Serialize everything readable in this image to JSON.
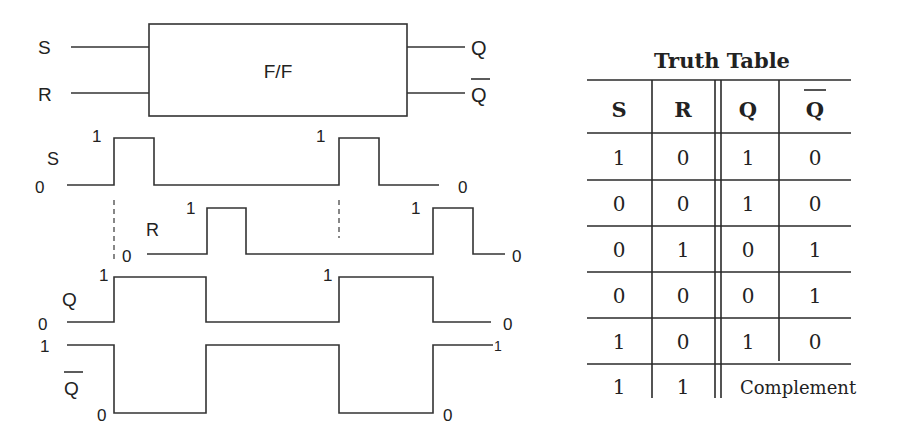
{
  "block": {
    "label": "F/F",
    "inputs": [
      "S",
      "R"
    ],
    "outputs": [
      "Q",
      "Q̄"
    ]
  },
  "timing": {
    "signals": [
      {
        "name": "S",
        "start_level": "0",
        "end_level": "0",
        "pulse_labels": [
          "1",
          "1"
        ]
      },
      {
        "name": "R",
        "start_level": "0",
        "end_level": "0",
        "pulse_labels": [
          "1",
          "1"
        ]
      },
      {
        "name": "Q",
        "start_level": "0",
        "end_level": "0",
        "pulse_labels": [
          "1",
          "1"
        ]
      },
      {
        "name": "Q̄",
        "start_level": "1",
        "end_level": "1",
        "low_labels": [
          "0",
          "0"
        ]
      }
    ]
  },
  "truth_table": {
    "title": "Truth Table",
    "headers": [
      "S",
      "R",
      "Q",
      "Q"
    ],
    "rows": [
      [
        "1",
        "0",
        "1",
        "0"
      ],
      [
        "0",
        "0",
        "1",
        "0"
      ],
      [
        "0",
        "1",
        "0",
        "1"
      ],
      [
        "0",
        "0",
        "0",
        "1"
      ],
      [
        "1",
        "0",
        "1",
        "0"
      ],
      [
        "1",
        "1",
        "Complement",
        ""
      ]
    ]
  }
}
